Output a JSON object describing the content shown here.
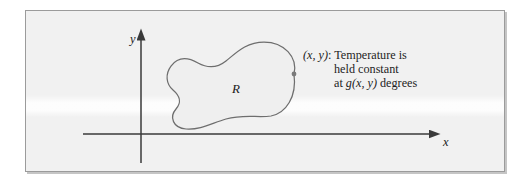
{
  "figure": {
    "kind": "math-diagram",
    "background_color": "#f1f1f1",
    "frame_color": "#9b9b9b",
    "ink_color": "#4f4f4f",
    "axes": {
      "x_label": "x",
      "y_label": "y",
      "origin_px": [
        115,
        123
      ],
      "x_axis_arrow": "right",
      "y_axis_arrow": "up"
    },
    "region": {
      "label": "R",
      "outline_color": "#6e6e6e",
      "fill_color": "#efefef",
      "shape": "peanut-blob"
    },
    "boundary_point": {
      "marker": "dot",
      "color": "#6e6e6e",
      "position_px": [
        268,
        63
      ]
    },
    "annotation": {
      "line1_point": "(x, y)",
      "line1_suffix": ": Temperature is",
      "line2": "held constant",
      "line3_prefix": "at ",
      "line3_function": "g(x, y)",
      "line3_suffix": " degrees"
    }
  }
}
